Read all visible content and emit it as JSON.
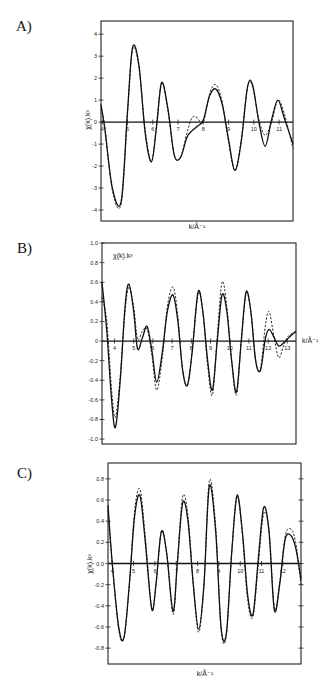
{
  "panels": [
    {
      "label": "A)"
    },
    {
      "label": "B)"
    },
    {
      "label": "C)"
    }
  ],
  "chart_data": [
    {
      "type": "line",
      "panel": "A)",
      "title": "",
      "xlabel": "k/Å⁻¹",
      "ylabel": "χ(k).k³",
      "xlim": [
        3.95,
        11.55
      ],
      "ylim": [
        -4.5,
        4.6
      ],
      "xticks": [
        4,
        5,
        6,
        7,
        8,
        9,
        10,
        11
      ],
      "yticks": [
        4,
        3,
        2,
        1,
        0,
        -1,
        -2,
        -3,
        -4
      ],
      "grid": false,
      "legend": null,
      "series": [
        {
          "name": "experimental",
          "style": "solid",
          "x": [
            3.95,
            4.1,
            4.4,
            4.75,
            5.0,
            5.2,
            5.45,
            5.7,
            5.95,
            6.15,
            6.35,
            6.6,
            6.85,
            7.1,
            7.35,
            7.55,
            7.75,
            8.0,
            8.25,
            8.5,
            8.75,
            9.0,
            9.25,
            9.5,
            9.75,
            9.95,
            10.2,
            10.45,
            10.7,
            10.95,
            11.2,
            11.55
          ],
          "y": [
            0.8,
            -0.3,
            -3.0,
            -3.6,
            0.5,
            3.4,
            2.6,
            -0.5,
            -1.8,
            -0.2,
            1.8,
            0.6,
            -1.5,
            -1.6,
            -0.7,
            -0.4,
            -0.2,
            0.1,
            1.2,
            1.5,
            0.8,
            -0.8,
            -2.2,
            -0.9,
            1.6,
            1.7,
            0.0,
            -1.1,
            0.1,
            1.0,
            0.2,
            -1.0
          ]
        },
        {
          "name": "calculated",
          "style": "dashed",
          "x": [
            3.95,
            4.1,
            4.4,
            4.75,
            5.0,
            5.2,
            5.45,
            5.7,
            5.95,
            6.15,
            6.35,
            6.6,
            6.85,
            7.1,
            7.35,
            7.55,
            7.75,
            8.0,
            8.25,
            8.5,
            8.75,
            9.0,
            9.25,
            9.5,
            9.75,
            9.95,
            10.2,
            10.45,
            10.7,
            10.95,
            11.2,
            11.55
          ],
          "y": [
            0.6,
            -0.2,
            -3.1,
            -3.7,
            0.4,
            3.3,
            2.5,
            -0.4,
            -1.8,
            -0.1,
            1.8,
            0.5,
            -1.5,
            -1.6,
            -0.5,
            0.2,
            0.2,
            0.0,
            1.3,
            1.7,
            0.9,
            -0.9,
            -2.2,
            -0.8,
            1.6,
            1.6,
            0.1,
            -0.6,
            0.0,
            1.0,
            0.4,
            -1.2
          ]
        }
      ]
    },
    {
      "type": "line",
      "panel": "B)",
      "title": "",
      "xlabel": "k/Å⁻¹",
      "ylabel": "χ(k).k³",
      "xlim": [
        3.35,
        13.45
      ],
      "ylim": [
        -1.05,
        1.0
      ],
      "xticks": [
        4,
        5,
        6,
        7,
        8,
        9,
        10,
        11,
        12,
        13
      ],
      "yticks": [
        1.0,
        0.8,
        0.6,
        0.4,
        0.2,
        0,
        -0.2,
        -0.4,
        -0.6,
        -0.8,
        -1.0
      ],
      "grid": false,
      "legend": null,
      "series": [
        {
          "name": "experimental",
          "style": "solid",
          "x": [
            3.35,
            3.6,
            3.85,
            4.05,
            4.3,
            4.55,
            4.75,
            5.0,
            5.2,
            5.45,
            5.7,
            5.95,
            6.2,
            6.5,
            6.75,
            7.05,
            7.3,
            7.55,
            7.8,
            8.05,
            8.35,
            8.6,
            8.85,
            9.1,
            9.35,
            9.6,
            9.85,
            10.1,
            10.35,
            10.6,
            10.85,
            11.1,
            11.35,
            11.6,
            11.85,
            12.05,
            12.3,
            12.55,
            12.8,
            13.05,
            13.45
          ],
          "y": [
            0.6,
            0.1,
            -0.6,
            -0.88,
            -0.4,
            0.35,
            0.58,
            0.3,
            -0.08,
            0.03,
            0.15,
            -0.1,
            -0.42,
            -0.1,
            0.3,
            0.47,
            0.2,
            -0.3,
            -0.45,
            -0.1,
            0.5,
            0.3,
            -0.2,
            -0.5,
            0.0,
            0.47,
            0.3,
            -0.2,
            -0.52,
            0.0,
            0.5,
            0.3,
            -0.2,
            -0.3,
            0.02,
            0.12,
            0.04,
            -0.05,
            -0.02,
            0.03,
            0.1
          ]
        },
        {
          "name": "calculated",
          "style": "dashed",
          "x": [
            3.35,
            3.6,
            3.85,
            4.05,
            4.3,
            4.55,
            4.75,
            5.0,
            5.2,
            5.45,
            5.7,
            5.95,
            6.2,
            6.5,
            6.75,
            7.05,
            7.3,
            7.55,
            7.8,
            8.05,
            8.35,
            8.6,
            8.85,
            9.1,
            9.35,
            9.6,
            9.85,
            10.1,
            10.35,
            10.6,
            10.85,
            11.1,
            11.35,
            11.6,
            11.85,
            12.05,
            12.3,
            12.55,
            12.8,
            13.05,
            13.45
          ],
          "y": [
            0.45,
            0.2,
            -0.5,
            -0.78,
            -0.35,
            0.3,
            0.55,
            0.35,
            0.02,
            0.1,
            0.12,
            -0.15,
            -0.5,
            -0.15,
            0.35,
            0.55,
            0.25,
            -0.3,
            -0.45,
            -0.1,
            0.48,
            0.3,
            -0.25,
            -0.55,
            0.05,
            0.6,
            0.35,
            -0.2,
            -0.55,
            0.0,
            0.48,
            0.3,
            -0.2,
            -0.28,
            0.15,
            0.3,
            0.05,
            -0.17,
            -0.05,
            0.05,
            0.1
          ]
        }
      ]
    },
    {
      "type": "line",
      "panel": "C)",
      "title": "",
      "xlabel": "k/Å⁻¹",
      "ylabel": "χ(k).k³",
      "xlim": [
        3.8,
        12.85
      ],
      "ylim": [
        -0.95,
        0.95
      ],
      "xticks": [
        4,
        5,
        6,
        7,
        8,
        9,
        10,
        11,
        12
      ],
      "yticks": [
        0.8,
        0.6,
        0.4,
        0.2,
        0.0,
        -0.2,
        -0.4,
        -0.6,
        -0.8
      ],
      "grid": false,
      "legend": null,
      "series": [
        {
          "name": "experimental",
          "style": "solid",
          "x": [
            3.8,
            4.0,
            4.3,
            4.55,
            4.8,
            5.05,
            5.3,
            5.55,
            5.85,
            6.05,
            6.3,
            6.55,
            6.85,
            7.05,
            7.3,
            7.55,
            7.8,
            8.05,
            8.3,
            8.55,
            8.85,
            9.1,
            9.35,
            9.6,
            9.85,
            10.1,
            10.35,
            10.6,
            10.85,
            11.1,
            11.35,
            11.6,
            11.85,
            12.1,
            12.35,
            12.6,
            12.85
          ],
          "y": [
            0.55,
            0.0,
            -0.6,
            -0.7,
            -0.2,
            0.45,
            0.64,
            0.2,
            -0.43,
            -0.2,
            0.3,
            0.1,
            -0.45,
            0.0,
            0.57,
            0.4,
            -0.2,
            -0.62,
            -0.2,
            0.73,
            0.3,
            -0.6,
            -0.66,
            0.1,
            0.64,
            0.3,
            -0.3,
            -0.48,
            0.05,
            0.53,
            0.3,
            -0.44,
            -0.2,
            0.22,
            0.27,
            0.15,
            -0.15
          ]
        },
        {
          "name": "calculated",
          "style": "dashed",
          "x": [
            3.8,
            4.0,
            4.3,
            4.55,
            4.8,
            5.05,
            5.3,
            5.55,
            5.85,
            6.05,
            6.3,
            6.55,
            6.85,
            7.05,
            7.3,
            7.55,
            7.8,
            8.05,
            8.3,
            8.55,
            8.85,
            9.1,
            9.35,
            9.6,
            9.85,
            10.1,
            10.35,
            10.6,
            10.85,
            11.1,
            11.35,
            11.6,
            11.85,
            12.1,
            12.35,
            12.6,
            12.85
          ],
          "y": [
            0.5,
            0.0,
            -0.62,
            -0.7,
            -0.2,
            0.5,
            0.7,
            0.25,
            -0.42,
            -0.2,
            0.3,
            0.1,
            -0.48,
            0.0,
            0.63,
            0.45,
            -0.2,
            -0.65,
            -0.2,
            0.78,
            0.35,
            -0.62,
            -0.68,
            0.1,
            0.65,
            0.28,
            -0.35,
            -0.5,
            0.0,
            0.47,
            0.32,
            -0.42,
            -0.18,
            0.25,
            0.33,
            0.2,
            -0.2
          ]
        }
      ]
    }
  ]
}
